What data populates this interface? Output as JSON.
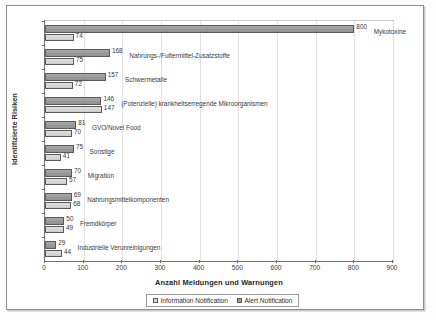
{
  "chart_data": {
    "type": "bar",
    "orientation": "horizontal",
    "title": "",
    "xlabel": "Anzahl Meldungen und Warnungen",
    "ylabel": "Identifizierte Risiken",
    "xlim": [
      0,
      900
    ],
    "xticks": [
      0,
      100,
      200,
      300,
      400,
      500,
      600,
      700,
      800,
      900
    ],
    "grid": true,
    "legend_position": "bottom",
    "categories": [
      "Mykotoxine",
      "Nahrungs-/Futtermittel-Zusatzstoffe",
      "Schwermetalle",
      "(Potenzielle) krankheitserregende Mikroorganismen",
      "GVO/Novel Food",
      "Sonstige",
      "Migration",
      "Nahrungsmittelkomponenten",
      "Fremdkörper",
      "Industrielle Verunreinigungen"
    ],
    "series": [
      {
        "name": "Alert Notification",
        "color": "#9c9c9c",
        "values": [
          800,
          168,
          157,
          146,
          81,
          75,
          70,
          69,
          50,
          29
        ]
      },
      {
        "name": "Information Notification",
        "color": "#d8d8d8",
        "values": [
          74,
          75,
          72,
          147,
          70,
          41,
          57,
          68,
          49,
          44
        ]
      }
    ]
  },
  "legend": {
    "items": [
      {
        "label": "Information Notification",
        "key": "info"
      },
      {
        "label": "Alert Notification",
        "key": "alert"
      }
    ]
  }
}
